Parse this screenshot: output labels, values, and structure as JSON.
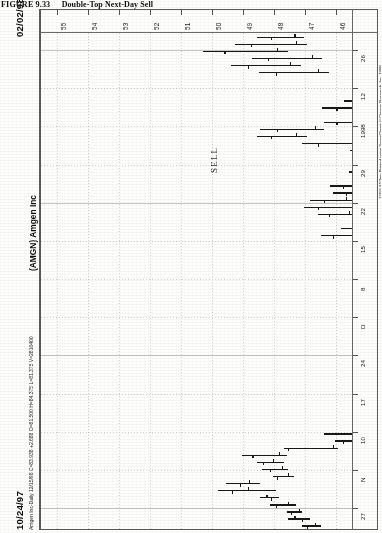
{
  "figure": {
    "number": "FIGURE 9.33",
    "caption": "Double-Top Next-Day Sell",
    "full_caption": "FIGURE 9.33   Double-Top Next-Day Sell"
  },
  "chart_header": {
    "symbol_label": "(AMGN) Amgen Inc",
    "start_date": "10/24/97",
    "end_date": "02/02/98",
    "quote_line": "Amgen Inc-Daily  12/15/98  C=83.938  +2.688  O=81.500  H=84.375  L=81.375  V=2810400",
    "quote_fields": {
      "name": "Amgen Inc-Daily",
      "date": "12/15/98",
      "close": "C=83.938",
      "change": "+2.688",
      "open": "O=81.500",
      "high": "H=84.375",
      "low": "L=81.375",
      "volume": "V=2810400"
    }
  },
  "annotations": [
    {
      "text": "SELL",
      "name": "sell-annotation"
    }
  ],
  "copyright": "12/16  4:53pm  Printed using SuperCharts © Omega Research, Inc. 1998",
  "chart_data": {
    "type": "bar",
    "subtype": "ohlc-price-bars",
    "title": "(AMGN) Amgen Inc",
    "xlabel": "Price",
    "ylabel": "Date",
    "orientation": "rotated-90",
    "grid": true,
    "legend": "none",
    "price_axis": {
      "position": "top",
      "ticks": [
        "55",
        "54",
        "53",
        "52",
        "51",
        "50",
        "49",
        "48",
        "47",
        "46"
      ],
      "range": [
        55.5,
        45.5
      ]
    },
    "date_axis": {
      "position": "right",
      "ticks": [
        "27",
        "N",
        "10",
        "17",
        "24",
        "D",
        "8",
        "15",
        "22",
        "29",
        "1998",
        "12",
        "26"
      ],
      "start": "10/24/97",
      "end": "02/02/98"
    },
    "bars": [
      {
        "i": 0,
        "low": 46.5,
        "high": 47.1,
        "open": 46.7,
        "close": 46.95
      },
      {
        "i": 1,
        "low": 46.85,
        "high": 47.55,
        "open": 47.35,
        "close": 47.1
      },
      {
        "i": 2,
        "low": 47.1,
        "high": 47.6,
        "open": 47.2,
        "close": 47.45
      },
      {
        "i": 3,
        "low": 47.3,
        "high": 48.15,
        "open": 47.55,
        "close": 47.95
      },
      {
        "i": 4,
        "low": 47.85,
        "high": 48.45,
        "open": 48.25,
        "close": 48.1
      },
      {
        "i": 5,
        "low": 47.95,
        "high": 49.8,
        "open": 48.85,
        "close": 49.35
      },
      {
        "i": 6,
        "low": 48.45,
        "high": 49.55,
        "open": 48.8,
        "close": 49.1
      },
      {
        "i": 7,
        "low": 47.35,
        "high": 48.05,
        "open": 47.55,
        "close": 47.9
      },
      {
        "i": 8,
        "low": 47.55,
        "high": 48.4,
        "open": 47.75,
        "close": 48.15
      },
      {
        "i": 9,
        "low": 47.7,
        "high": 48.55,
        "open": 48.05,
        "close": 48.35
      },
      {
        "i": 10,
        "low": 47.6,
        "high": 49.05,
        "open": 47.85,
        "close": 48.7
      },
      {
        "i": 11,
        "low": 45.95,
        "high": 47.7,
        "open": 46.1,
        "close": 47.55
      },
      {
        "i": 12,
        "low": 43.65,
        "high": 46.05,
        "open": 44.1,
        "close": 45.8
      },
      {
        "i": 13,
        "low": 44.2,
        "high": 46.4,
        "open": 44.55,
        "close": 45.1
      },
      {
        "i": 14,
        "low": 43.8,
        "high": 45.05,
        "open": 44.05,
        "close": 44.55
      },
      {
        "i": 15,
        "low": 43.55,
        "high": 44.45,
        "open": 43.8,
        "close": 44.1
      },
      {
        "i": 16,
        "low": 43.35,
        "high": 44.3,
        "open": 43.6,
        "close": 44.05
      },
      {
        "i": 17,
        "low": 43.9,
        "high": 44.85,
        "open": 44.1,
        "close": 44.6
      },
      {
        "i": 18,
        "low": 43.1,
        "high": 44.05,
        "open": 43.35,
        "close": 43.8
      },
      {
        "i": 19,
        "low": 43.45,
        "high": 44.1,
        "open": 43.7,
        "close": 43.95
      },
      {
        "i": 20,
        "low": 42.95,
        "high": 43.85,
        "open": 43.2,
        "close": 43.55
      },
      {
        "i": 21,
        "low": 41.95,
        "high": 44.0,
        "open": 42.3,
        "close": 43.7
      },
      {
        "i": 22,
        "low": 43.3,
        "high": 44.1,
        "open": 43.55,
        "close": 43.85
      },
      {
        "i": 23,
        "low": 43.55,
        "high": 43.95,
        "open": 43.65,
        "close": 43.85
      },
      {
        "i": 24,
        "low": 42.3,
        "high": 44.25,
        "open": 42.65,
        "close": 43.95
      },
      {
        "i": 25,
        "low": 44.6,
        "high": 45.3,
        "open": 44.8,
        "close": 45.05
      },
      {
        "i": 26,
        "low": 44.2,
        "high": 45.2,
        "open": 44.45,
        "close": 44.95
      },
      {
        "i": 27,
        "low": 43.85,
        "high": 44.7,
        "open": 44.1,
        "close": 44.4
      },
      {
        "i": 28,
        "low": 43.6,
        "high": 45.0,
        "open": 43.85,
        "close": 44.65
      },
      {
        "i": 29,
        "low": 42.65,
        "high": 43.95,
        "open": 42.95,
        "close": 43.6
      },
      {
        "i": 30,
        "low": 42.2,
        "high": 44.0,
        "open": 42.55,
        "close": 43.55
      },
      {
        "i": 31,
        "low": 41.05,
        "high": 42.15,
        "open": 41.3,
        "close": 41.9
      },
      {
        "i": 32,
        "low": 41.5,
        "high": 44.2,
        "open": 41.8,
        "close": 43.85
      },
      {
        "i": 33,
        "low": 43.75,
        "high": 44.55,
        "open": 43.95,
        "close": 44.3
      },
      {
        "i": 34,
        "low": 43.95,
        "high": 44.85,
        "open": 44.15,
        "close": 44.55
      },
      {
        "i": 35,
        "low": 44.05,
        "high": 44.95,
        "open": 44.25,
        "close": 44.7
      },
      {
        "i": 36,
        "low": 43.8,
        "high": 44.7,
        "open": 44.0,
        "close": 44.45
      },
      {
        "i": 37,
        "low": 43.85,
        "high": 44.9,
        "open": 44.05,
        "close": 44.6
      },
      {
        "i": 38,
        "low": 43.95,
        "high": 44.8,
        "open": 44.2,
        "close": 44.55
      },
      {
        "i": 39,
        "low": 42.4,
        "high": 45.0,
        "open": 42.75,
        "close": 44.7
      },
      {
        "i": 40,
        "low": 43.75,
        "high": 45.05,
        "open": 44.0,
        "close": 44.6
      },
      {
        "i": 41,
        "low": 44.8,
        "high": 46.5,
        "open": 45.1,
        "close": 46.1
      },
      {
        "i": 42,
        "low": 44.55,
        "high": 45.85,
        "open": 44.85,
        "close": 45.45
      },
      {
        "i": 43,
        "low": 43.95,
        "high": 45.4,
        "open": 44.25,
        "close": 45.0
      },
      {
        "i": 44,
        "low": 45.3,
        "high": 46.6,
        "open": 45.6,
        "close": 46.25
      },
      {
        "i": 45,
        "low": 45.1,
        "high": 47.05,
        "open": 45.45,
        "close": 46.6
      },
      {
        "i": 46,
        "low": 45.4,
        "high": 46.85,
        "open": 45.7,
        "close": 46.4
      },
      {
        "i": 47,
        "low": 44.6,
        "high": 46.1,
        "open": 44.9,
        "close": 45.7
      },
      {
        "i": 48,
        "low": 43.85,
        "high": 46.2,
        "open": 44.2,
        "close": 45.8
      },
      {
        "i": 49,
        "low": 44.25,
        "high": 45.25,
        "open": 44.5,
        "close": 44.95
      },
      {
        "i": 50,
        "low": 44.45,
        "high": 45.6,
        "open": 44.7,
        "close": 45.2
      },
      {
        "i": 51,
        "low": 43.55,
        "high": 44.85,
        "open": 43.85,
        "close": 44.45
      },
      {
        "i": 52,
        "low": 41.85,
        "high": 42.9,
        "open": 42.05,
        "close": 42.6
      },
      {
        "i": 53,
        "low": 43.0,
        "high": 45.55,
        "open": 43.35,
        "close": 45.1
      },
      {
        "i": 54,
        "low": 45.2,
        "high": 47.1,
        "open": 45.5,
        "close": 46.6
      },
      {
        "i": 55,
        "low": 46.95,
        "high": 48.55,
        "open": 47.3,
        "close": 48.1
      },
      {
        "i": 56,
        "low": 46.4,
        "high": 48.45,
        "open": 46.7,
        "close": 47.9
      },
      {
        "i": 57,
        "low": 44.85,
        "high": 46.4,
        "open": 45.1,
        "close": 46.0
      },
      {
        "i": 58,
        "low": 44.05,
        "high": 45.5,
        "open": 44.3,
        "close": 45.05
      },
      {
        "i": 59,
        "low": 44.9,
        "high": 46.45,
        "open": 45.2,
        "close": 46.0
      },
      {
        "i": 60,
        "low": 44.25,
        "high": 45.75,
        "open": 44.5,
        "close": 45.35
      },
      {
        "i": 61,
        "low": 42.55,
        "high": 43.65,
        "open": 42.8,
        "close": 43.35
      },
      {
        "i": 62,
        "low": 42.1,
        "high": 44.0,
        "open": 42.4,
        "close": 43.55
      },
      {
        "i": 63,
        "low": 43.15,
        "high": 45.5,
        "open": 43.45,
        "close": 45.05
      },
      {
        "i": 64,
        "low": 46.25,
        "high": 48.5,
        "open": 46.6,
        "close": 47.95
      },
      {
        "i": 65,
        "low": 47.15,
        "high": 49.4,
        "open": 47.5,
        "close": 48.85
      },
      {
        "i": 66,
        "low": 46.45,
        "high": 48.7,
        "open": 46.8,
        "close": 48.2
      },
      {
        "i": 67,
        "low": 47.55,
        "high": 50.3,
        "open": 47.9,
        "close": 49.6
      },
      {
        "i": 68,
        "low": 46.95,
        "high": 49.25,
        "open": 47.3,
        "close": 48.75
      },
      {
        "i": 69,
        "low": 47.05,
        "high": 48.55,
        "open": 47.35,
        "close": 48.1
      }
    ]
  }
}
